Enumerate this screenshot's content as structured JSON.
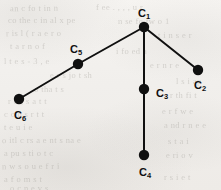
{
  "figure": {
    "kind": "graph-diagram",
    "title": "",
    "background_color": "#f3f1ee",
    "ink_color": "#101010",
    "width": 221,
    "height": 190
  },
  "graph_data": {
    "type": "tree",
    "node_radius": 5.2,
    "edge_width": 2.0,
    "nodes": [
      {
        "id": "C1",
        "label": "C",
        "subscript": "1",
        "x": 144,
        "y": 27,
        "label_x": 144,
        "label_y": 13,
        "label_position": "above"
      },
      {
        "id": "C2",
        "label": "C",
        "subscript": "2",
        "x": 198,
        "y": 70,
        "label_x": 200,
        "label_y": 85,
        "label_position": "below"
      },
      {
        "id": "C3",
        "label": "C",
        "subscript": "3",
        "x": 144,
        "y": 89,
        "label_x": 162,
        "label_y": 93,
        "label_position": "right"
      },
      {
        "id": "C4",
        "label": "C",
        "subscript": "4",
        "x": 144,
        "y": 155,
        "label_x": 145,
        "label_y": 172,
        "label_position": "below"
      },
      {
        "id": "C5",
        "label": "C",
        "subscript": "5",
        "x": 78,
        "y": 64,
        "label_x": 76,
        "label_y": 49,
        "label_position": "above"
      },
      {
        "id": "C6",
        "label": "C",
        "subscript": "6",
        "x": 19,
        "y": 99,
        "label_x": 20,
        "label_y": 115,
        "label_position": "below"
      }
    ],
    "edges": [
      {
        "from": "C1",
        "to": "C5"
      },
      {
        "from": "C5",
        "to": "C6"
      },
      {
        "from": "C1",
        "to": "C2"
      },
      {
        "from": "C1",
        "to": "C3"
      },
      {
        "from": "C3",
        "to": "C4"
      }
    ]
  },
  "background_ghost_text": [
    {
      "text": "an  c fo  t  in  n",
      "x": 10,
      "y": 3,
      "size": 8.5,
      "rotate": -0.4
    },
    {
      "text": "f  ee   . , , ,  u  r",
      "x": 96,
      "y": 2,
      "size": 8.5,
      "rotate": -0.3
    },
    {
      "text": "co  the  c  in  al  x  pe",
      "x": 8,
      "y": 15,
      "size": 8.5,
      "rotate": -0.2
    },
    {
      "text": "n  se  fo  tw  o  1",
      "x": 118,
      "y": 16,
      "size": 8.5,
      "rotate": 0.2
    },
    {
      "text": "r  is   l  (  r  a  e  r  o",
      "x": 6,
      "y": 28,
      "size": 8.5,
      "rotate": -0.3
    },
    {
      "text": "t   i  n   s  e  r",
      "x": 158,
      "y": 30,
      "size": 8.5,
      "rotate": 0.1
    },
    {
      "text": "t  a   r   n  o  f",
      "x": 10,
      "y": 41,
      "size": 8.5,
      "rotate": -0.2
    },
    {
      "text": "i  fo  ed  a",
      "x": 116,
      "y": 46,
      "size": 8.5,
      "rotate": 0.2
    },
    {
      "text": "l    t  e   s    -   3  ,    e",
      "x": 4,
      "y": 56,
      "size": 8.5,
      "rotate": -0.2
    },
    {
      "text": "e    r     n  r   e",
      "x": 150,
      "y": 60,
      "size": 8.5,
      "rotate": 0.2
    },
    {
      "text": "e    r    s  jo  t    sh",
      "x": 50,
      "y": 70,
      "size": 8.5,
      "rotate": -0.1
    },
    {
      "text": "l   s  i    ap",
      "x": 176,
      "y": 76,
      "size": 8.5,
      "rotate": 0.1
    },
    {
      "text": "o  tha  t   s",
      "x": 34,
      "y": 84,
      "size": 8.5,
      "rotate": -0.2
    },
    {
      "text": "r  th  fi  t",
      "x": 170,
      "y": 90,
      "size": 8.5,
      "rotate": 0.2
    },
    {
      "text": "r  o   ,   s   a   t  t",
      "x": 8,
      "y": 96,
      "size": 8.5,
      "rotate": -0.2
    },
    {
      "text": "c     c  o  s  r  t   t",
      "x": 4,
      "y": 109,
      "size": 8.5,
      "rotate": -0.2
    },
    {
      "text": "e   r   f   w   e",
      "x": 162,
      "y": 106,
      "size": 8.5,
      "rotate": 0.2
    },
    {
      "text": "t   e   u   i     e",
      "x": 4,
      "y": 122,
      "size": 8.5,
      "rotate": -0.3
    },
    {
      "text": "a  nd   r  n  e   e",
      "x": 164,
      "y": 120,
      "size": 8.5,
      "rotate": 0.2
    },
    {
      "text": "o  itl   c  rs  a   e    nt  s  na  e",
      "x": 2,
      "y": 135,
      "size": 8.5,
      "rotate": -0.2
    },
    {
      "text": "s   t    a   i",
      "x": 168,
      "y": 136,
      "size": 8.5,
      "rotate": 0.2
    },
    {
      "text": "a   pu    s   ti    o   t  c",
      "x": 4,
      "y": 148,
      "size": 8.5,
      "rotate": -0.2
    },
    {
      "text": "e   ri    o   v",
      "x": 166,
      "y": 150,
      "size": 8.5,
      "rotate": 0.2
    },
    {
      "text": "n   w    s     o  u    e    f  r   i",
      "x": 2,
      "y": 161,
      "size": 8.5,
      "rotate": -0.3
    },
    {
      "text": "a   f    o     m   s   t",
      "x": 4,
      "y": 174,
      "size": 8.5,
      "rotate": -0.2
    },
    {
      "text": "r   s    i    e    t",
      "x": 164,
      "y": 172,
      "size": 8.5,
      "rotate": 0.2
    },
    {
      "text": "o   c    n    e    v    s",
      "x": 10,
      "y": 183,
      "size": 8.5,
      "rotate": -0.2
    }
  ]
}
